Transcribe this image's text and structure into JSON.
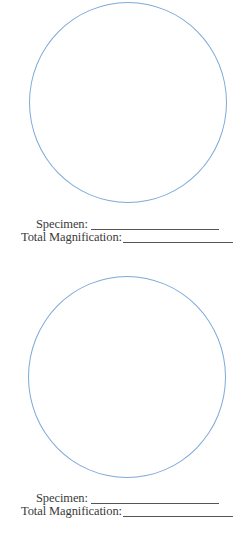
{
  "page": {
    "fields": [
      {
        "circle_color": "#7fa9d8",
        "specimen_label": "Specimen:",
        "magnification_label": "Total Magnification:"
      },
      {
        "circle_color": "#7fa9d8",
        "specimen_label": "Specimen:",
        "magnification_label": "Total Magnification:"
      }
    ]
  }
}
